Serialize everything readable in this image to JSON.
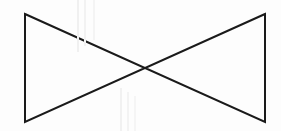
{
  "figure": {
    "background_color": "#fdfdfd",
    "stroke_color": "#1a1a1a",
    "stroke_width": 2,
    "canvas": {
      "width": 281,
      "height": 131
    },
    "vertices": {
      "top_left": {
        "x": 25,
        "y": 14
      },
      "top_right": {
        "x": 265,
        "y": 14
      },
      "bottom_left": {
        "x": 25,
        "y": 122
      },
      "bottom_right": {
        "x": 265,
        "y": 122
      },
      "center_crossing": {
        "x": 145,
        "y": 68
      }
    },
    "shapes": [
      {
        "name": "left-triangle",
        "points": "25,14 145,68 25,122",
        "closed": true
      },
      {
        "name": "right-triangle",
        "points": "265,14 145,68 265,122",
        "closed": true
      }
    ],
    "edges": [
      {
        "name": "left-vertical-edge",
        "x1": 25,
        "y1": 14,
        "x2": 25,
        "y2": 122
      },
      {
        "name": "right-vertical-edge",
        "x1": 265,
        "y1": 14,
        "x2": 265,
        "y2": 122
      },
      {
        "name": "top-left-to-bottom-right-diagonal",
        "x1": 25,
        "y1": 14,
        "x2": 265,
        "y2": 122
      },
      {
        "name": "top-right-to-bottom-left-diagonal",
        "x1": 265,
        "y1": 14,
        "x2": 25,
        "y2": 122
      }
    ],
    "scan_artifacts": [
      {
        "x": 77,
        "y": 0,
        "width": 2,
        "height": 52,
        "color": "#f0f0f0"
      },
      {
        "x": 84,
        "y": 0,
        "width": 2,
        "height": 46,
        "color": "#f2f2f2"
      },
      {
        "x": 93,
        "y": 0,
        "width": 2,
        "height": 40,
        "color": "#f4f4f4"
      },
      {
        "x": 120,
        "y": 88,
        "width": 2,
        "height": 43,
        "color": "#f1f1f1"
      },
      {
        "x": 127,
        "y": 92,
        "width": 2,
        "height": 39,
        "color": "#f3f3f3"
      },
      {
        "x": 134,
        "y": 96,
        "width": 2,
        "height": 35,
        "color": "#f5f5f5"
      }
    ]
  }
}
